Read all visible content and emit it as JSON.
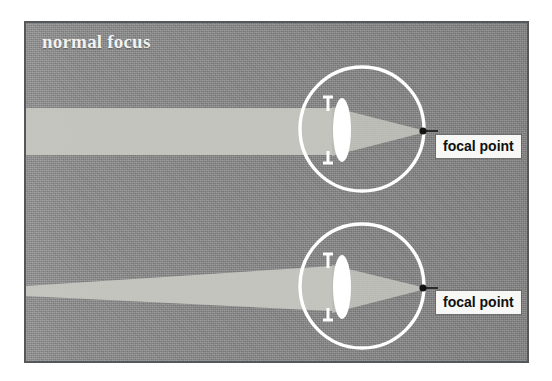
{
  "figure": {
    "title": "normal focus",
    "background_color": "#8b8b8b",
    "frame_border_color": "#55585a",
    "ray_color": "#c9c9c3",
    "eye_outline_color": "#ffffff",
    "lens_color": "#ffffff",
    "focal_point_dot_color": "#141414",
    "label_text_color": "#101010",
    "label_background_color": "#f7f7f5",
    "title_color": "#f2f2f0"
  },
  "diagrams": [
    {
      "id": "upper-eye",
      "beam_type": "parallel",
      "beam_description": "parallel band of light entering the eye",
      "focal_label": "focal point"
    },
    {
      "id": "lower-eye",
      "beam_type": "converging",
      "beam_description": "cone of light from a near object widening toward the eye",
      "focal_label": "focal point"
    }
  ]
}
